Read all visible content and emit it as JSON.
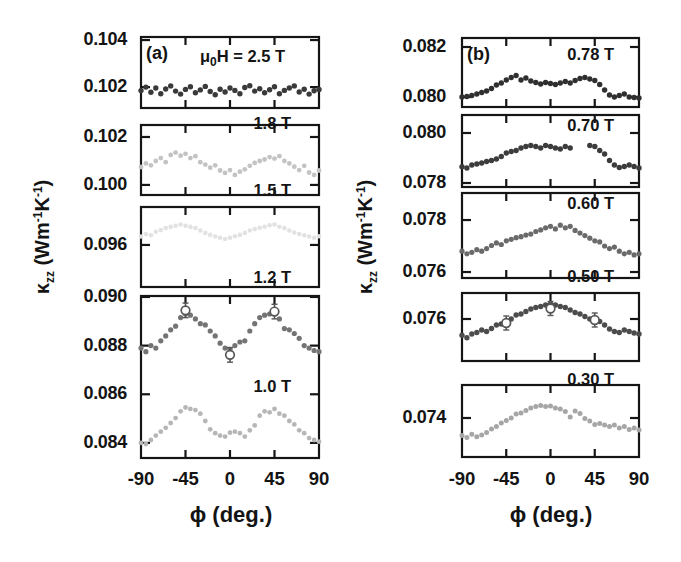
{
  "figure": {
    "panel_a_letter": "(a)",
    "panel_b_letter": "(b)",
    "field_header": {
      "mu": "μ",
      "sub": "0",
      "rest": "H = 2.5 T"
    },
    "ylabel": {
      "kappa": "κ",
      "kappa_sub": "zz",
      "unit_open": " (Wm",
      "sup1": "-1",
      "unit_mid": "K",
      "sup2": "-1",
      "unit_close": ")"
    },
    "colors": {
      "frame": "#151515",
      "text": "#141414",
      "background": "#ffffff",
      "error_marker": "#565656"
    }
  },
  "chart_data": [
    {
      "type": "scatter",
      "panel": "a",
      "xlabel": "ϕ (deg.)",
      "ylabel": "κzz (Wm⁻¹K⁻¹)",
      "x_range": [
        -90,
        90
      ],
      "x_ticks": [
        -90,
        -45,
        0,
        45,
        90
      ],
      "x_tick_labels": [
        "-90",
        "-45",
        "0",
        "45",
        "90"
      ],
      "x_minor_ticks": [
        -45,
        0,
        45
      ],
      "segments": [
        {
          "y_range": [
            0.10111,
            0.10413
          ],
          "y_ticks": [
            {
              "value": 0.104,
              "label": "0.104"
            },
            {
              "value": 0.102,
              "label": "0.102"
            }
          ],
          "series": [
            {
              "name": "2.5 T",
              "color": "#3a3a3a",
              "marker": 2.7,
              "phi_start": -90,
              "phi_step": 5,
              "values": [
                0.10185,
                0.102,
                0.10178,
                0.10196,
                0.10172,
                0.10192,
                0.10205,
                0.10183,
                0.1017,
                0.1019,
                0.10201,
                0.10176,
                0.10188,
                0.10203,
                0.10181,
                0.10167,
                0.10191,
                0.10179,
                0.10196,
                0.10186,
                0.10172,
                0.10198,
                0.10206,
                0.10183,
                0.10193,
                0.10176,
                0.10189,
                0.10201,
                0.10172,
                0.10186,
                0.10196,
                0.10205,
                0.10179,
                0.10191,
                0.1017,
                0.10184,
                0.1019
              ],
              "highlights": []
            }
          ]
        },
        {
          "y_range": [
            0.09958,
            0.1025
          ],
          "y_ticks": [
            {
              "value": 0.102,
              "label": "0.102"
            },
            {
              "value": 0.1,
              "label": "0.100"
            }
          ],
          "series": [
            {
              "name": "1.8 T",
              "color": "#c3c3c3",
              "marker": 2.4,
              "phi_start": -90,
              "phi_step": 5,
              "values": [
                0.10075,
                0.1009,
                0.10082,
                0.101,
                0.10112,
                0.10095,
                0.10125,
                0.10135,
                0.10122,
                0.1013,
                0.10112,
                0.1012,
                0.10095,
                0.10085,
                0.10072,
                0.10082,
                0.1006,
                0.1005,
                0.10062,
                0.10042,
                0.10055,
                0.10065,
                0.1008,
                0.10092,
                0.101,
                0.10106,
                0.10116,
                0.1011,
                0.1012,
                0.101,
                0.1009,
                0.10076,
                0.10062,
                0.1008,
                0.10052,
                0.10042,
                0.1006
              ],
              "highlights": []
            }
          ]
        },
        {
          "y_range": [
            0.09425,
            0.09758
          ],
          "y_ticks": [
            {
              "value": 0.096,
              "label": "0.096"
            }
          ],
          "series": [
            {
              "name": "1.5 T",
              "color": "#e2e2e2",
              "marker": 2.3,
              "phi_start": -90,
              "phi_step": 5,
              "values": [
                0.09635,
                0.09645,
                0.0964,
                0.09655,
                0.09662,
                0.0967,
                0.09675,
                0.0968,
                0.09685,
                0.0968,
                0.09675,
                0.0967,
                0.0966,
                0.0965,
                0.09642,
                0.09635,
                0.0963,
                0.09625,
                0.0963,
                0.09636,
                0.09642,
                0.0965,
                0.0966,
                0.09666,
                0.09672,
                0.09676,
                0.09682,
                0.09685,
                0.09676,
                0.0967,
                0.0966,
                0.09652,
                0.09645,
                0.0964,
                0.09635,
                0.0963,
                0.09636
              ],
              "highlights": []
            }
          ]
        },
        {
          "y_range": [
            0.08338,
            0.09004
          ],
          "y_ticks": [
            {
              "value": 0.09,
              "label": "0.090"
            },
            {
              "value": 0.088,
              "label": "0.088"
            },
            {
              "value": 0.086,
              "label": "0.086"
            },
            {
              "value": 0.084,
              "label": "0.084"
            }
          ],
          "series": [
            {
              "name": "1.2 T",
              "color": "#747474",
              "marker": 2.6,
              "phi_start": -90,
              "phi_step": 5,
              "values": [
                0.0879,
                0.08775,
                0.088,
                0.0879,
                0.0882,
                0.0884,
                0.08865,
                0.0888,
                0.08915,
                0.0893,
                0.08925,
                0.0891,
                0.0889,
                0.08885,
                0.0886,
                0.0884,
                0.0881,
                0.0879,
                0.08785,
                0.088,
                0.08815,
                0.0882,
                0.0886,
                0.0889,
                0.08915,
                0.08925,
                0.0893,
                0.08935,
                0.0891,
                0.0887,
                0.08865,
                0.0885,
                0.0883,
                0.088,
                0.0879,
                0.0878,
                0.08775
              ],
              "highlights": [
                {
                  "phi": -45,
                  "value": 0.08945,
                  "err": 0.0003
                },
                {
                  "phi": 0,
                  "value": 0.08762,
                  "err": 0.0003
                },
                {
                  "phi": 45,
                  "value": 0.0894,
                  "err": 0.0003
                }
              ]
            },
            {
              "name": "1.0 T",
              "color": "#b6b6b6",
              "marker": 2.4,
              "phi_start": -90,
              "phi_step": 5,
              "values": [
                0.084,
                0.08395,
                0.08412,
                0.0843,
                0.08446,
                0.08462,
                0.08482,
                0.08502,
                0.0853,
                0.08546,
                0.0854,
                0.08535,
                0.0852,
                0.0849,
                0.08456,
                0.0844,
                0.0843,
                0.08426,
                0.08442,
                0.08446,
                0.0844,
                0.08426,
                0.08452,
                0.08472,
                0.08512,
                0.0853,
                0.08526,
                0.0854,
                0.0852,
                0.08512,
                0.0849,
                0.08476,
                0.08452,
                0.0844,
                0.0842,
                0.08412,
                0.08405
              ],
              "highlights": []
            }
          ]
        }
      ]
    },
    {
      "type": "scatter",
      "panel": "b",
      "xlabel": "ϕ (deg.)",
      "ylabel": "κzz (Wm⁻¹K⁻¹)",
      "x_range": [
        -90,
        90
      ],
      "x_ticks": [
        -90,
        -45,
        0,
        45,
        90
      ],
      "x_tick_labels": [
        "-90",
        "-45",
        "0",
        "45",
        "90"
      ],
      "x_minor_ticks": [
        -45,
        0,
        45
      ],
      "segments": [
        {
          "y_range": [
            0.0796,
            0.08236
          ],
          "y_ticks": [
            {
              "value": 0.082,
              "label": "0.082"
            },
            {
              "value": 0.08,
              "label": "0.080"
            }
          ],
          "series": [
            {
              "name": "0.78 T",
              "color": "#2f2f2f",
              "marker": 2.7,
              "phi_start": -90,
              "phi_step": 5,
              "values": [
                0.08,
                0.08002,
                0.08006,
                0.08012,
                0.08018,
                0.08024,
                0.08034,
                0.08048,
                0.08056,
                0.08068,
                0.08078,
                0.08086,
                0.08068,
                0.08076,
                0.08064,
                0.08058,
                0.08052,
                0.08058,
                0.08054,
                0.0805,
                0.08056,
                0.08062,
                0.08056,
                0.08066,
                0.08074,
                0.08078,
                0.08072,
                0.08066,
                0.0805,
                0.08028,
                0.08008,
                0.08,
                0.08006,
                0.08012,
                0.08,
                0.07998,
                0.07996
              ],
              "highlights": []
            }
          ]
        },
        {
          "y_range": [
            0.07784,
            0.08072
          ],
          "y_ticks": [
            {
              "value": 0.08,
              "label": "0.080"
            },
            {
              "value": 0.078,
              "label": "0.078"
            }
          ],
          "series": [
            {
              "name": "0.70 T",
              "color": "#3c3c3c",
              "marker": 2.7,
              "phi_start": -90,
              "phi_step": 5,
              "values": [
                0.07865,
                0.0786,
                0.07872,
                0.07876,
                0.0788,
                0.07886,
                0.0789,
                0.07896,
                0.07906,
                0.0792,
                0.07926,
                0.0793,
                0.0794,
                0.07946,
                0.0795,
                0.07946,
                0.0794,
                0.0795,
                0.07946,
                0.0794,
                0.07936,
                0.07946,
                0.0794,
                null,
                null,
                null,
                0.0795,
                0.07946,
                0.0793,
                0.07916,
                0.0789,
                0.07872,
                0.07862,
                0.07866,
                0.07872,
                0.07866,
                0.0786
              ],
              "highlights": []
            }
          ]
        },
        {
          "y_range": [
            0.07577,
            0.07904
          ],
          "y_ticks": [
            {
              "value": 0.078,
              "label": "0.078"
            },
            {
              "value": 0.076,
              "label": "0.076"
            }
          ],
          "series": [
            {
              "name": "0.60 T",
              "color": "#6a6a6a",
              "marker": 2.6,
              "phi_start": -90,
              "phi_step": 5,
              "values": [
                0.0768,
                0.0767,
                0.07676,
                0.07686,
                0.0768,
                0.0769,
                0.07702,
                0.07712,
                0.07706,
                0.0772,
                0.07726,
                0.07732,
                0.07736,
                0.07742,
                0.07746,
                0.07756,
                0.07762,
                0.0777,
                0.07776,
                0.07766,
                0.0778,
                0.0777,
                0.07776,
                0.0776,
                0.0775,
                0.0774,
                0.0773,
                0.0772,
                0.07716,
                0.077,
                0.0769,
                0.07696,
                0.0768,
                0.0767,
                0.07676,
                0.07666,
                0.0767
              ],
              "highlights": []
            }
          ]
        },
        {
          "y_range": [
            0.07432,
            0.07704
          ],
          "y_ticks": [
            {
              "value": 0.076,
              "label": "0.076"
            }
          ],
          "series": [
            {
              "name": "0.50 T",
              "color": "#4c4c4c",
              "marker": 2.7,
              "phi_start": -90,
              "phi_step": 5,
              "values": [
                0.07535,
                0.07525,
                0.0754,
                0.07546,
                0.07556,
                0.0755,
                0.07562,
                0.07576,
                0.0758,
                0.07588,
                0.076,
                0.07616,
                0.0762,
                0.0763,
                0.0764,
                0.07646,
                0.0765,
                0.07656,
                0.0766,
                0.07656,
                0.0765,
                0.07646,
                0.07636,
                0.07626,
                0.0762,
                0.0761,
                0.076,
                0.07596,
                0.0759,
                0.07576,
                0.0756,
                0.0755,
                0.07546,
                0.07556,
                0.0755,
                0.07544,
                0.0754
              ],
              "highlights": [
                {
                  "phi": -45,
                  "value": 0.07584,
                  "err": 0.00028
                },
                {
                  "phi": 0,
                  "value": 0.07642,
                  "err": 0.00028
                },
                {
                  "phi": 45,
                  "value": 0.07596,
                  "err": 0.00028
                }
              ]
            }
          ]
        },
        {
          "y_range": [
            0.07244,
            0.07532
          ],
          "y_ticks": [
            {
              "value": 0.074,
              "label": "0.074"
            }
          ],
          "series": [
            {
              "name": "0.30 T",
              "color": "#a6a6a6",
              "marker": 2.5,
              "phi_start": -90,
              "phi_step": 5,
              "values": [
                0.0733,
                0.07322,
                0.07335,
                0.07325,
                0.07332,
                0.07342,
                0.07356,
                0.07366,
                0.0738,
                0.0739,
                0.074,
                0.07416,
                0.0742,
                0.0743,
                0.0744,
                0.07446,
                0.0745,
                0.07446,
                0.07448,
                0.0744,
                0.07436,
                0.07426,
                0.07404,
                0.07428,
                0.07418,
                0.07398,
                0.07388,
                0.07374,
                0.07378,
                0.07372,
                0.07366,
                0.07372,
                0.0736,
                0.07366,
                0.07354,
                0.0736,
                0.07352
              ],
              "highlights": []
            }
          ]
        }
      ]
    }
  ]
}
